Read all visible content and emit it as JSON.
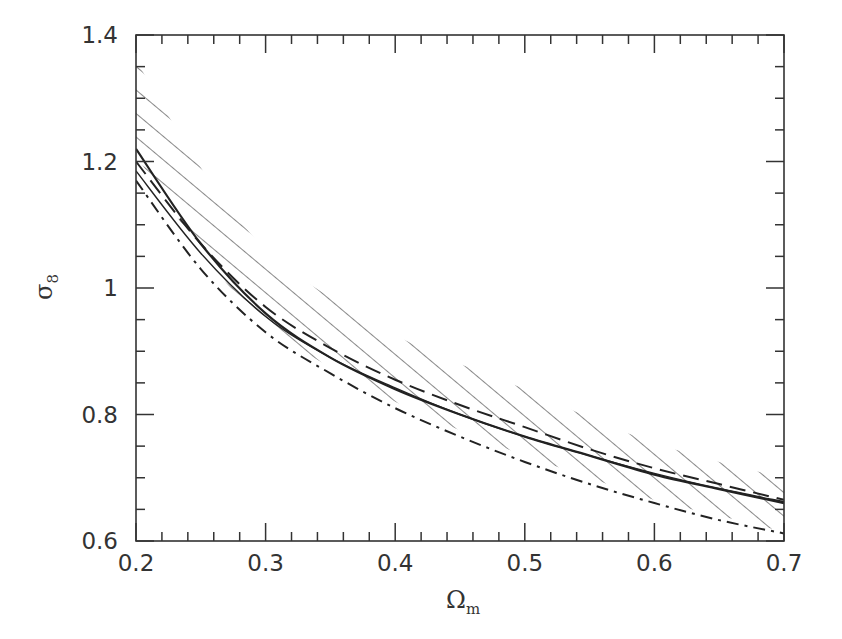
{
  "chart_data": {
    "type": "line",
    "title": "",
    "xlabel": "Ωm",
    "ylabel": "σ8",
    "xlabel_main": "Ω",
    "xlabel_sub": "m",
    "ylabel_main": "σ",
    "ylabel_sub": "8",
    "xlim": [
      0.2,
      0.7
    ],
    "ylim": [
      0.6,
      1.4
    ],
    "xticks": [
      0.2,
      0.3,
      0.4,
      0.5,
      0.6,
      0.7
    ],
    "xtick_labels": [
      "0.2",
      "0.3",
      "0.4",
      "0.5",
      "0.6",
      "0.7"
    ],
    "yticks": [
      0.6,
      0.8,
      1.0,
      1.2,
      1.4
    ],
    "ytick_labels": [
      "0.6",
      "0.8",
      "1",
      "1.2",
      "1.4"
    ],
    "grid": false,
    "legend": null,
    "x": [
      0.2,
      0.25,
      0.3,
      0.35,
      0.4,
      0.45,
      0.5,
      0.55,
      0.6,
      0.65,
      0.7
    ],
    "series": [
      {
        "name": "solid",
        "style": "solid",
        "values": [
          1.22,
          1.07,
          0.96,
          0.89,
          0.84,
          0.8,
          0.765,
          0.735,
          0.705,
          0.682,
          0.66
        ]
      },
      {
        "name": "dashed",
        "style": "dashed",
        "values": [
          1.2,
          1.07,
          0.97,
          0.905,
          0.855,
          0.815,
          0.78,
          0.745,
          0.715,
          0.69,
          0.665
        ]
      },
      {
        "name": "solid-thin",
        "style": "solid",
        "values": [
          1.185,
          1.055,
          0.955,
          0.89,
          0.842,
          0.8,
          0.765,
          0.735,
          0.707,
          0.683,
          0.662
        ]
      },
      {
        "name": "dash-dot",
        "style": "dashdot",
        "values": [
          1.17,
          1.03,
          0.93,
          0.865,
          0.81,
          0.765,
          0.725,
          0.69,
          0.66,
          0.633,
          0.612
        ]
      }
    ],
    "shaded_region": {
      "name": "hatched-band",
      "style": "diagonal-hatch",
      "upper": [
        1.36,
        1.19,
        1.06,
        0.985,
        0.925,
        0.88,
        0.84,
        0.795,
        0.755,
        0.725,
        0.7
      ],
      "lower": [
        1.21,
        1.06,
        0.94,
        0.875,
        0.82,
        0.775,
        0.735,
        0.7,
        0.665,
        0.64,
        0.615
      ]
    }
  },
  "colors": {
    "axis": "#333333",
    "line": "#222222",
    "hatch": "#555555",
    "background": "#ffffff"
  }
}
